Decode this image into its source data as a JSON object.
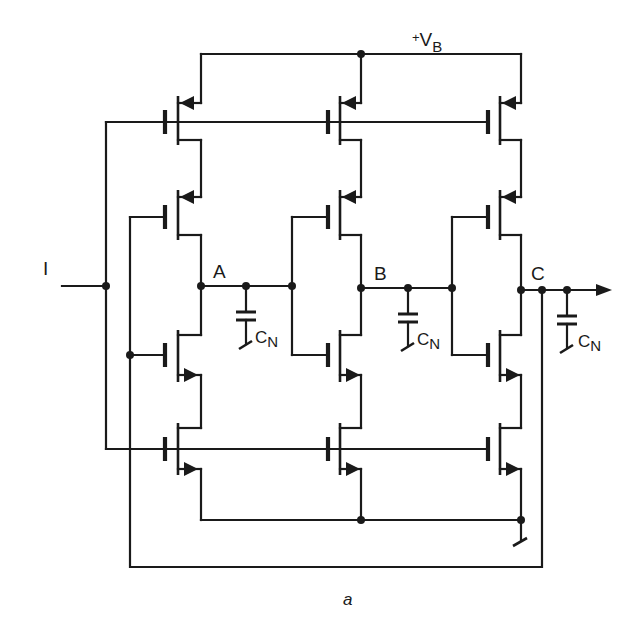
{
  "figure": {
    "caption": "a",
    "title_supply": {
      "prefix": "+V",
      "sub": "B"
    },
    "input_label": "I",
    "nodes": [
      {
        "name": "A",
        "x": 201,
        "y": 286
      },
      {
        "name": "B",
        "x": 361,
        "y": 288
      },
      {
        "name": "C",
        "x": 521,
        "y": 290
      }
    ],
    "capacitors": [
      {
        "label": "C",
        "sub": "N",
        "x": 246
      },
      {
        "label": "C",
        "sub": "N",
        "x": 408
      },
      {
        "label": "C",
        "sub": "N",
        "x": 567
      }
    ],
    "colors": {
      "ink": "#1a1a1a",
      "background": "#ffffff"
    }
  },
  "columns": [
    {
      "id": "stage-1",
      "channel_x": 178,
      "gate_x": 165,
      "rail_x": 201
    },
    {
      "id": "stage-2",
      "channel_x": 340,
      "gate_x": 328,
      "rail_x": 361
    },
    {
      "id": "stage-3",
      "channel_x": 500,
      "gate_x": 488,
      "rail_x": 521
    }
  ],
  "transistors": [
    {
      "type": "PMOS",
      "role": "current-source",
      "row": 1,
      "top": 96,
      "bottom": 145,
      "arrow_y": 103,
      "gate_y": 122
    },
    {
      "type": "PMOS",
      "role": "switch",
      "row": 2,
      "top": 190,
      "bottom": 240,
      "arrow_y": 197,
      "gate_y": 217
    },
    {
      "type": "NMOS",
      "role": "switch",
      "row": 3,
      "top": 330,
      "bottom": 382,
      "arrow_y": 375,
      "gate_y": 355
    },
    {
      "type": "NMOS",
      "role": "current-source",
      "row": 4,
      "top": 423,
      "bottom": 475,
      "arrow_y": 469,
      "gate_y": 449
    }
  ],
  "rails": {
    "vb_y": 54,
    "ground_y": 520,
    "feedback_y": 567,
    "feedback_left_x": 130,
    "feedback_right_x": 542,
    "bias_left_x": 106,
    "input_y": 286,
    "output_arrow_end_x": 612
  },
  "labels": {
    "supply": "+V",
    "supply_sub": "B",
    "input": "I",
    "node_a": "A",
    "node_b": "B",
    "node_c": "C",
    "cap_main": "C",
    "cap_sub": "N",
    "caption": "a"
  }
}
